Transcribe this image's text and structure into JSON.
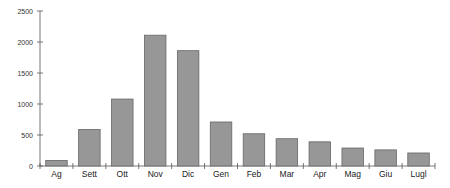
{
  "chart_data": {
    "type": "bar",
    "title": "",
    "xlabel": "",
    "ylabel": "",
    "categories": [
      "Ag",
      "Sett",
      "Ott",
      "Nov",
      "Dic",
      "Gen",
      "Feb",
      "Mar",
      "Apr",
      "Mag",
      "Giu",
      "Lugl"
    ],
    "values": [
      90,
      590,
      1080,
      2110,
      1860,
      710,
      520,
      440,
      390,
      290,
      260,
      210
    ],
    "ylim": [
      0,
      2500
    ],
    "yticks": [
      0,
      500,
      1000,
      1500,
      2000,
      2500
    ],
    "grid": false,
    "legend": "none",
    "bar_color": "#979797",
    "bar_edge_color": "#666666"
  }
}
